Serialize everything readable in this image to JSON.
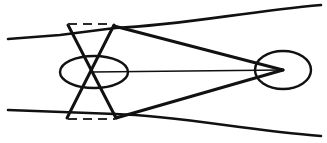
{
  "figure": {
    "background_color": "#ffffff",
    "ink_color": "#111111",
    "dash_color": "#2b2b2b",
    "canvas": {
      "width": 327,
      "height": 143
    }
  },
  "chart_data": {
    "type": "line",
    "subtitle": "",
    "xlabel": "",
    "ylabel": "",
    "xlim": [
      0,
      327
    ],
    "ylim": [
      0,
      143
    ],
    "grid": false,
    "legend": "none",
    "annotations": [],
    "series": [
      {
        "name": "upper-incoming-ray",
        "kind": "polyline",
        "stroke_width": 2.6,
        "dash": "none",
        "points": [
          [
            8,
            39
          ],
          [
            60,
            35
          ],
          [
            115,
            28
          ]
        ]
      },
      {
        "name": "lower-incoming-ray",
        "kind": "polyline",
        "stroke_width": 2.6,
        "dash": "none",
        "points": [
          [
            8,
            110
          ],
          [
            62,
            112
          ],
          [
            115,
            114
          ]
        ]
      },
      {
        "name": "upper-outgoing-curve",
        "kind": "bezier",
        "stroke_width": 2.6,
        "dash": "none",
        "points": [
          [
            115,
            28
          ],
          [
            183,
            25
          ],
          [
            243,
            12
          ],
          [
            321,
            5
          ]
        ]
      },
      {
        "name": "lower-outgoing-curve",
        "kind": "bezier",
        "stroke_width": 2.6,
        "dash": "none",
        "points": [
          [
            115,
            114
          ],
          [
            180,
            116
          ],
          [
            244,
            130
          ],
          [
            321,
            136
          ]
        ]
      },
      {
        "name": "bowtie-diagonal-down-right",
        "kind": "polyline",
        "stroke_width": 3.0,
        "dash": "none",
        "points": [
          [
            68,
            25
          ],
          [
            116,
            118
          ]
        ]
      },
      {
        "name": "bowtie-diagonal-down-left",
        "kind": "polyline",
        "stroke_width": 3.0,
        "dash": "none",
        "points": [
          [
            114,
            25
          ],
          [
            67,
            118
          ]
        ]
      },
      {
        "name": "upper-converging-ray",
        "kind": "polyline",
        "stroke_width": 3.0,
        "dash": "none",
        "points": [
          [
            114,
            26
          ],
          [
            283,
            70
          ]
        ]
      },
      {
        "name": "lower-converging-ray",
        "kind": "polyline",
        "stroke_width": 3.0,
        "dash": "none",
        "points": [
          [
            116,
            118
          ],
          [
            283,
            70
          ]
        ]
      },
      {
        "name": "optical-axis",
        "kind": "polyline",
        "stroke_width": 1.5,
        "dash": "none",
        "points": [
          [
            92,
            72
          ],
          [
            283,
            70
          ]
        ]
      },
      {
        "name": "top-dashed-reference",
        "kind": "polyline",
        "stroke_width": 2.2,
        "dash": "9 6",
        "points": [
          [
            68,
            24
          ],
          [
            113,
            24
          ]
        ]
      },
      {
        "name": "bottom-dashed-reference",
        "kind": "polyline",
        "stroke_width": 2.2,
        "dash": "9 6",
        "points": [
          [
            68,
            119
          ],
          [
            115,
            119
          ]
        ]
      }
    ],
    "shapes": [
      {
        "name": "left-ellipse",
        "kind": "ellipse",
        "cx": 94,
        "cy": 72,
        "rx": 34,
        "ry": 16,
        "stroke_width": 2.4
      },
      {
        "name": "right-ellipse",
        "kind": "ellipse",
        "cx": 283,
        "cy": 70,
        "rx": 28,
        "ry": 19,
        "stroke_width": 2.4
      }
    ]
  }
}
